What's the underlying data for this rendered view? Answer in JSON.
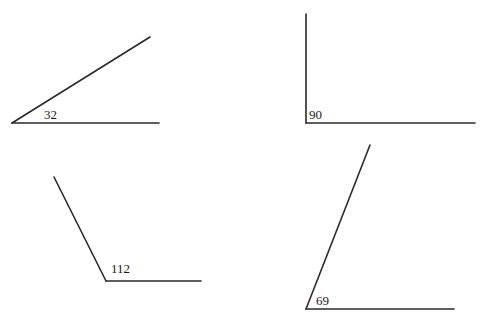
{
  "angles": [
    {
      "label": "32",
      "vertex": [
        12,
        123
      ],
      "ray_end": [
        150,
        37
      ],
      "base_end": [
        159,
        123
      ],
      "label_pos": [
        44,
        108
      ]
    },
    {
      "label": "90",
      "vertex": [
        306,
        123
      ],
      "ray_end": [
        306,
        14
      ],
      "base_end": [
        475,
        123
      ],
      "label_pos": [
        309,
        108
      ]
    },
    {
      "label": "112",
      "vertex": [
        106,
        281
      ],
      "ray_end": [
        54,
        177
      ],
      "base_end": [
        201,
        281
      ],
      "label_pos": [
        111,
        262
      ]
    },
    {
      "label": "69",
      "vertex": [
        306,
        309
      ],
      "ray_end": [
        370,
        145
      ],
      "base_end": [
        454,
        309
      ],
      "label_pos": [
        316,
        294
      ]
    }
  ],
  "colors": {
    "line": "#2a2a2a",
    "text": "#1a1a1a",
    "background": "#ffffff"
  }
}
